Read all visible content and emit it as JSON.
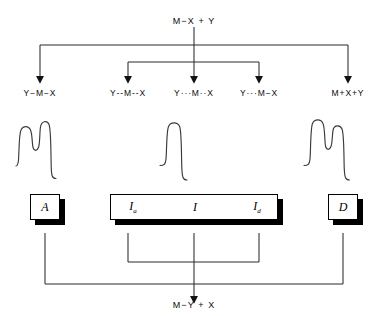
{
  "diagram": {
    "title_top": "M−X + Y",
    "title_bottom": "M−Y + X",
    "nodes_row": [
      {
        "id": "n1",
        "label": "Y−M−X"
      },
      {
        "id": "n2",
        "label": "Y‑‑M‑‑X"
      },
      {
        "id": "n3",
        "label": "Y···M··X"
      },
      {
        "id": "n4",
        "label": "Y···M−X"
      },
      {
        "id": "n5",
        "label": "M+X+Y"
      }
    ],
    "traces": [
      {
        "id": "t1",
        "name": "double-peak-trace-left",
        "shape": "doublet"
      },
      {
        "id": "t2",
        "name": "single-peak-trace-center",
        "shape": "singlet"
      },
      {
        "id": "t3",
        "name": "double-peak-trace-right",
        "shape": "doublet"
      }
    ],
    "boxes": {
      "left": {
        "label": "A"
      },
      "center": {
        "left_label": "I",
        "left_sub": "a",
        "center_label": "I",
        "right_label": "I",
        "right_sub": "d"
      },
      "right": {
        "label": "D"
      }
    },
    "colors": {
      "ink": "#000000",
      "line": "#2b2b2b",
      "paper": "#ffffff"
    }
  }
}
